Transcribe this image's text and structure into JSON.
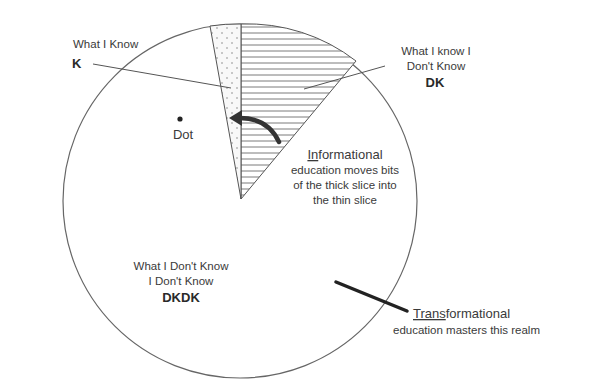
{
  "diagram": {
    "type": "pie-knowledge-model",
    "slices": [
      {
        "id": "K",
        "title": "What I Know",
        "abbr": "K",
        "pattern": "dotted"
      },
      {
        "id": "DK",
        "title_line1": "What I know I",
        "title_line2": "Don't Know",
        "abbr": "DK",
        "pattern": "horizontal-lines"
      },
      {
        "id": "DKDK",
        "title_line1": "What I Don't Know",
        "title_line2": "I Don't Know",
        "abbr": "DKDK",
        "pattern": "blank"
      }
    ],
    "dot_label": "Dot",
    "informational": {
      "underlined": "In",
      "rest": "formational",
      "line2": "education moves bits",
      "line3": "of the thick slice into",
      "line4": "the thin slice"
    },
    "transformational": {
      "underlined": "Trans",
      "rest": "formational",
      "line2": "education masters this realm"
    },
    "colors": {
      "stroke": "#555555",
      "text": "#3a3a3a",
      "arrow": "#333333"
    }
  }
}
